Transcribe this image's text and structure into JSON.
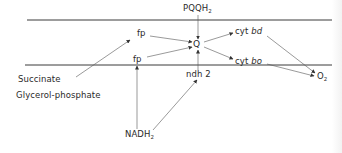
{
  "diagram": {
    "type": "electron-transport-chain",
    "membrane": {
      "top_line": {
        "x1": 27,
        "x2": 332,
        "y": 20
      },
      "bottom_line": {
        "x1": 25,
        "x2": 332,
        "y": 65
      }
    },
    "nodes": {
      "pqqh2": {
        "label": "PQQH",
        "sub": "2"
      },
      "q": {
        "label": "Q"
      },
      "fp_upper": {
        "label": "fp"
      },
      "fp_lower": {
        "label": "fp"
      },
      "ndh2": {
        "label": "ndh 2"
      },
      "cyt_bd": {
        "prefix": "cyt ",
        "italic": "bd"
      },
      "cyt_bo": {
        "prefix": "cyt ",
        "italic": "bo"
      },
      "o2": {
        "label": "O",
        "sub": "2"
      },
      "succinate": {
        "label": "Succinate"
      },
      "glycerol_phosphate": {
        "label": "Glycerol-phosphate"
      },
      "nadh2": {
        "label": "NADH",
        "sub": "2"
      }
    },
    "edges": [
      {
        "from": "PQQH2",
        "to": "Q"
      },
      {
        "from": "ndh 2",
        "to": "Q"
      },
      {
        "from": "fp (upper)",
        "to": "Q"
      },
      {
        "from": "fp (lower)",
        "to": "Q"
      },
      {
        "from": "Q",
        "to": "cyt bd"
      },
      {
        "from": "Q",
        "to": "cyt bo"
      },
      {
        "from": "cyt bd",
        "to": "O2"
      },
      {
        "from": "cyt bo",
        "to": "O2"
      },
      {
        "from": "Succinate / Glycerol-phosphate",
        "to": "fp (upper)"
      },
      {
        "from": "NADH2",
        "to": "fp (lower)"
      },
      {
        "from": "NADH2",
        "to": "ndh 2"
      }
    ],
    "colors": {
      "line": "#3a3a3a",
      "text": "#2a2a2a",
      "background": "#ffffff"
    }
  }
}
